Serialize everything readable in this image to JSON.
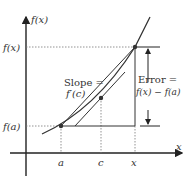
{
  "diagram": {
    "type": "mean-value-theorem-error-illustration",
    "axes": {
      "y_axis_label": "f(x)",
      "x_axis_label": "x"
    },
    "y_ticks": [
      {
        "label": "f(x)",
        "level": "fx"
      },
      {
        "label": "f(a)",
        "level": "fa"
      }
    ],
    "x_ticks": [
      {
        "label": "a"
      },
      {
        "label": "c"
      },
      {
        "label": "x"
      }
    ],
    "annotations": {
      "slope_line1": "Slope =",
      "slope_line2": "f′(c)",
      "error_line1": "Error =",
      "error_line2": "f(x) − f(a)"
    },
    "colors": {
      "curve": "#333333",
      "axis": "#222222",
      "dotted": "#777777",
      "text": "#333333"
    }
  }
}
